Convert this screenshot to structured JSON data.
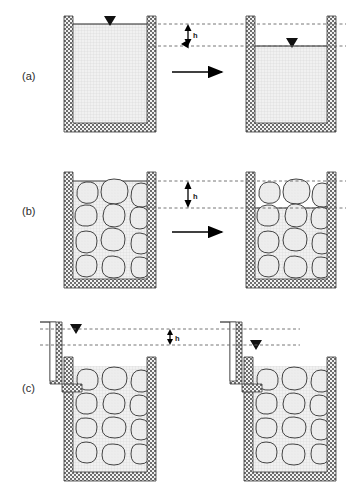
{
  "figure": {
    "width": 352,
    "height": 489,
    "background": "#ffffff"
  },
  "colors": {
    "wall_stroke": "#3a3a3a",
    "wall_fill": "#8e8e8e",
    "water_fill": "#ededed",
    "water_grid": "#c9c9c9",
    "water_surface": "#222222",
    "rock_fill": "#ebebeb",
    "rock_stroke": "#2f2f2f",
    "dashed_line": "#555555",
    "arrow": "#000000",
    "label_text": "#2b2b2b"
  },
  "panels": [
    {
      "id": "a",
      "label": "(a)",
      "label_x": 22,
      "label_y": 70,
      "description": "Open container filled with clear water; level drops by h",
      "head_symbol": "h",
      "fill_type": "water",
      "left_container": {
        "x": 64,
        "y": 16,
        "width": 92,
        "height": 116,
        "wall": 9,
        "water_level_y": 24,
        "water_marker_x": 110,
        "has_water_table_symbol": true
      },
      "right_container": {
        "x": 246,
        "y": 16,
        "width": 90,
        "height": 116,
        "wall": 9,
        "water_level_y": 46,
        "water_marker_x": 292,
        "has_water_table_symbol": true
      },
      "dashed_lines_y": [
        24,
        46
      ],
      "dashed_x_start": 156,
      "dashed_x_end": 346,
      "h_arrow_x": 188,
      "h_label_x": 193,
      "h_label_y": 38,
      "process_arrow": {
        "x1": 172,
        "x2": 226,
        "y": 72
      }
    },
    {
      "id": "b",
      "label": "(b)",
      "label_x": 22,
      "label_y": 205,
      "description": "Container filled with coarse aggregate and water; level drops by h",
      "head_symbol": "h",
      "fill_type": "aggregate-and-water",
      "left_container": {
        "x": 64,
        "y": 172,
        "width": 92,
        "height": 116,
        "wall": 9,
        "water_level_y": 181,
        "water_marker_x": 110,
        "has_water_table_symbol": false
      },
      "right_container": {
        "x": 246,
        "y": 172,
        "width": 90,
        "height": 116,
        "wall": 9,
        "water_level_y": 208,
        "water_marker_x": 292,
        "has_water_table_symbol": false
      },
      "dashed_lines_y": [
        181,
        208
      ],
      "dashed_x_start": 156,
      "dashed_x_end": 346,
      "h_arrow_x": 188,
      "h_label_x": 193,
      "h_label_y": 199,
      "process_arrow": {
        "x1": 172,
        "x2": 226,
        "y": 232
      }
    },
    {
      "id": "c",
      "label": "(c)",
      "label_x": 22,
      "label_y": 382,
      "description": "Container with aggregate and an external standpipe; piezometric head drops by h",
      "head_symbol": "h",
      "fill_type": "aggregate-and-water-with-standpipe",
      "left_container": {
        "x": 64,
        "y": 357,
        "width": 92,
        "height": 124,
        "wall": 9,
        "water_level_y": 329,
        "water_marker_x": 76,
        "has_water_table_symbol": true,
        "standpipe": {
          "x": 40,
          "y": 322,
          "width": 22,
          "height": 70
        }
      },
      "right_container": {
        "x": 244,
        "y": 357,
        "width": 92,
        "height": 124,
        "wall": 9,
        "water_level_y": 345,
        "water_marker_x": 256,
        "has_water_table_symbol": true,
        "standpipe": {
          "x": 220,
          "y": 322,
          "width": 22,
          "height": 70
        }
      },
      "dashed_lines_y": [
        329,
        345
      ],
      "dashed_x_start": 40,
      "dashed_x_end": 300,
      "h_arrow_x": 170,
      "h_label_x": 175,
      "h_label_y": 340
    }
  ],
  "symbols": {
    "water_table": "filled-down-triangle",
    "head_label": "h",
    "process_arrow": "rightwards-arrow"
  }
}
